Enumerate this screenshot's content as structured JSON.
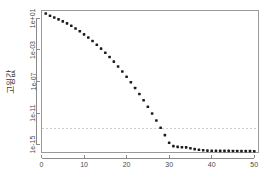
{
  "chart_data": {
    "type": "scatter",
    "title": "",
    "subtitle": "",
    "xlabel": "",
    "ylabel": "고윙값",
    "yscale": "log",
    "xscale": "linear",
    "xlim": [
      0,
      51
    ],
    "ylim": [
      1e-16,
      100
    ],
    "grid": false,
    "legend": null,
    "x_ticks": [
      0,
      10,
      20,
      30,
      40,
      50
    ],
    "x_tick_labels": [
      "0",
      "10",
      "20",
      "30",
      "40",
      "50"
    ],
    "y_ticks": [
      10,
      0.001,
      1e-07,
      1e-11,
      1e-15
    ],
    "y_tick_labels": [
      "1e+01",
      "1e-03",
      "1e-07",
      "1e-11",
      "1e-15"
    ],
    "annotations": [
      {
        "type": "hline",
        "label": "reference-threshold",
        "y": 1.2e-13,
        "style": "dashed",
        "color": "#cfcfcf"
      }
    ],
    "series": [
      {
        "name": "eigenvalues",
        "marker": "filled-square",
        "color": "#1c1c1c",
        "x": [
          1,
          2,
          3,
          4,
          5,
          6,
          7,
          8,
          9,
          10,
          11,
          12,
          13,
          14,
          15,
          16,
          17,
          18,
          19,
          20,
          21,
          22,
          23,
          24,
          25,
          26,
          27,
          28,
          29,
          30,
          31,
          32,
          33,
          34,
          35,
          36,
          37,
          38,
          39,
          40,
          41,
          42,
          43,
          44,
          45,
          46,
          47,
          48,
          49,
          50
        ],
        "y": [
          42.0,
          22.0,
          13.0,
          7.6,
          4.2,
          2.3,
          1.15,
          0.52,
          0.23,
          0.095,
          0.037,
          0.0135,
          0.0046,
          0.00148,
          0.00044,
          0.000125,
          3.3e-05,
          8e-06,
          1.85e-06,
          4e-07,
          8e-08,
          1.5e-08,
          2.6e-09,
          4.2e-10,
          6.3e-11,
          8.8e-12,
          1.15e-12,
          1.4e-13,
          1.6e-14,
          1.7e-15,
          6.5e-16,
          5.2e-16,
          4.6e-16,
          4.4e-16,
          3.4e-16,
          2.7e-16,
          2.2e-16,
          1.9e-16,
          1.75e-16,
          1.7e-16,
          1.65e-16,
          1.6e-16,
          1.6e-16,
          1.6e-16,
          1.55e-16,
          1.55e-16,
          1.5e-16,
          1.5e-16,
          1.5e-16,
          1.45e-16
        ]
      }
    ]
  }
}
